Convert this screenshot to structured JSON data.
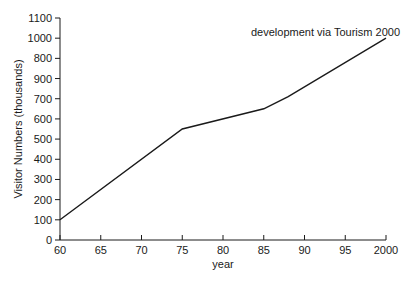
{
  "chart_data": {
    "type": "line",
    "title": "",
    "xlabel": "year",
    "ylabel": "Visitor Numbers (thousands)",
    "x_tick_labels": [
      "60",
      "65",
      "70",
      "75",
      "80",
      "85",
      "90",
      "95",
      "2000"
    ],
    "x_tick_years": [
      1960,
      1965,
      1970,
      1975,
      1980,
      1985,
      1990,
      1995,
      2000
    ],
    "y_tick_labels": [
      "0",
      "100",
      "200",
      "300",
      "400",
      "500",
      "600",
      "700",
      "900",
      "800",
      "1000",
      "1100"
    ],
    "y_tick_values": [
      0,
      100,
      200,
      300,
      400,
      500,
      600,
      700,
      800,
      900,
      1000,
      1100
    ],
    "xlim": [
      1960,
      2000
    ],
    "ylim": [
      0,
      1100
    ],
    "grid": false,
    "legend": null,
    "series": [
      {
        "name": "Visitor Numbers",
        "x": [
          1960,
          1975,
          1985,
          1988,
          2000
        ],
        "values": [
          100,
          550,
          650,
          710,
          1000
        ],
        "color": "#1a1a1a"
      }
    ],
    "annotations": [
      {
        "text": "development via Tourism 2000",
        "x": 2000,
        "y": 1000
      }
    ]
  }
}
